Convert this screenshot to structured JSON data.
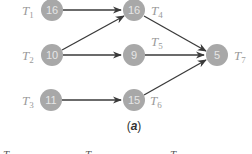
{
  "diagram": {
    "caption": {
      "open": "(",
      "letter": "a",
      "close": ")"
    },
    "nodes": [
      {
        "id": "T1",
        "prefix": "T",
        "sub": "1",
        "value": "16"
      },
      {
        "id": "T2",
        "prefix": "T",
        "sub": "2",
        "value": "10"
      },
      {
        "id": "T3",
        "prefix": "T",
        "sub": "3",
        "value": "11"
      },
      {
        "id": "T4",
        "prefix": "T",
        "sub": "4",
        "value": "16"
      },
      {
        "id": "T5",
        "prefix": "T",
        "sub": "5",
        "value": "9"
      },
      {
        "id": "T6",
        "prefix": "T",
        "sub": "6",
        "value": "15"
      },
      {
        "id": "T7",
        "prefix": "T",
        "sub": "7",
        "value": "5"
      }
    ],
    "edges": [
      {
        "from": "T1",
        "to": "T4"
      },
      {
        "from": "T2",
        "to": "T4"
      },
      {
        "from": "T2",
        "to": "T5"
      },
      {
        "from": "T3",
        "to": "T6"
      },
      {
        "from": "T4",
        "to": "T7"
      },
      {
        "from": "T5",
        "to": "T7"
      },
      {
        "from": "T6",
        "to": "T7"
      }
    ],
    "next_figure_partial_labels": [
      "T",
      "T",
      "T"
    ]
  }
}
